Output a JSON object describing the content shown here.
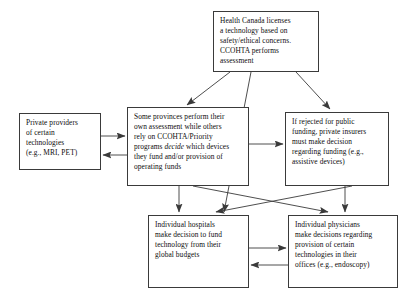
{
  "diagram": {
    "stroke_color": "#3a3a3a",
    "text_color": "#0d0d0d",
    "background": "#ffffff",
    "nodes": [
      {
        "id": "health-canada",
        "label": "Health Canada licenses a technology based on safety/ethical concerns. CCOHTA performs assessment",
        "lines": [
          "Health Canada licenses",
          "a technology based on",
          "safety/ethical concerns.",
          "CCOHTA performs",
          "assessment"
        ]
      },
      {
        "id": "private-providers",
        "label": "Private providers of certain technologies (e.g., MRI, PET)",
        "lines": [
          "Private providers",
          "of  certain",
          "technologies",
          "(e.g., MRI, PET)"
        ]
      },
      {
        "id": "provinces",
        "label": "Some provinces perform their own assessment while others rely on CCOHTA/Priority programs decide which devices they fund and/or provision of operating funds",
        "lines_pre": [
          "Some provinces perform their",
          "own assessment while others",
          "rely on CCOHTA/Priority",
          "programs "
        ],
        "italic_word": "decide",
        "lines_post": [
          " which devices",
          "they fund and/or provision of",
          "operating funds"
        ]
      },
      {
        "id": "rejected-public-funding",
        "label": "If rejected for public funding, private insurers must make decision regarding funding (e.g., assistive devices)",
        "lines": [
          "If rejected for public",
          "funding, private insurers",
          "must make decision",
          "regarding funding (e.g.,",
          "assistive devices)"
        ]
      },
      {
        "id": "individual-hospitals",
        "label": "Individual hospitals make decision to fund technology from their global budgets",
        "lines": [
          "Individual hospitals",
          "make decision to fund",
          "technology from their",
          "global budgets"
        ]
      },
      {
        "id": "individual-physicians",
        "label": "Individual physicians make decisions regarding provision of certain technologies in their offices (e.g., endoscopy)",
        "lines": [
          "Individual physicians",
          "make decisions regarding",
          "provision of certain",
          "technologies in their",
          "offices (e.g., endoscopy)"
        ]
      }
    ],
    "edges": [
      {
        "from": "health-canada",
        "to": "provinces",
        "type": "arrow"
      },
      {
        "from": "health-canada",
        "to": "rejected-public-funding",
        "type": "arrow"
      },
      {
        "from": "health-canada",
        "to": "individual-hospitals",
        "type": "arrow"
      },
      {
        "from": "private-providers",
        "to": "provinces",
        "type": "arrow"
      },
      {
        "from": "provinces",
        "to": "private-providers",
        "type": "arrow"
      },
      {
        "from": "provinces",
        "to": "rejected-public-funding",
        "type": "arrow"
      },
      {
        "from": "provinces",
        "to": "individual-hospitals",
        "type": "arrow"
      },
      {
        "from": "provinces",
        "to": "individual-physicians",
        "type": "arrow"
      },
      {
        "from": "rejected-public-funding",
        "to": "individual-hospitals",
        "type": "arrow"
      },
      {
        "from": "rejected-public-funding",
        "to": "individual-physicians",
        "type": "arrow"
      },
      {
        "from": "individual-hospitals",
        "to": "individual-physicians",
        "type": "arrow"
      },
      {
        "from": "individual-physicians",
        "to": "individual-hospitals",
        "type": "arrow"
      }
    ]
  }
}
